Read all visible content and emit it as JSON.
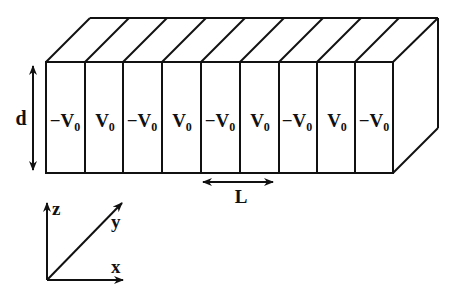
{
  "diagram": {
    "stripes": [
      {
        "label": "−V",
        "sub": "0"
      },
      {
        "label": "V",
        "sub": "0"
      },
      {
        "label": "−V",
        "sub": "0"
      },
      {
        "label": "V",
        "sub": "0"
      },
      {
        "label": "−V",
        "sub": "0"
      },
      {
        "label": "V",
        "sub": "0"
      },
      {
        "label": "−V",
        "sub": "0"
      },
      {
        "label": "V",
        "sub": "0"
      },
      {
        "label": "−V",
        "sub": "0"
      }
    ],
    "thickness_label": "d",
    "period_label": "L",
    "axes": {
      "z": "z",
      "y": "y",
      "x": "x"
    },
    "colors": {
      "line": "#111111",
      "background": "#ffffff"
    }
  }
}
